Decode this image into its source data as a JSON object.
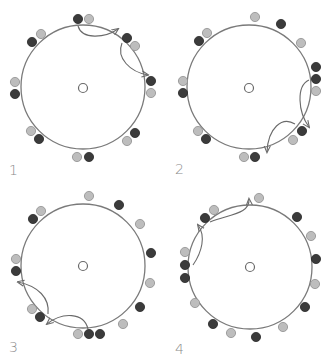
{
  "figure": {
    "colors": {
      "dark": "#3b3b3b",
      "light": "#bdbdbd",
      "ring": "#7a7a7a",
      "arrow": "#6a6a6a"
    },
    "panels": [
      {
        "label": "1"
      },
      {
        "label": "2"
      },
      {
        "label": "3"
      },
      {
        "label": "4"
      }
    ]
  }
}
